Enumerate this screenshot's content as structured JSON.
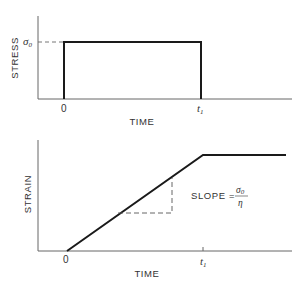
{
  "diagram": {
    "top_plot": {
      "ylabel": "STRESS",
      "xlabel": "TIME",
      "y_tick_label": "σ",
      "y_tick_sub": "0",
      "x_ticks": [
        "0",
        "t"
      ],
      "x_tick_t1_sub": "1",
      "curve": "rectangular stress pulse of magnitude σ0 from time 0 to t1"
    },
    "bottom_plot": {
      "ylabel": "STRAIN",
      "xlabel": "TIME",
      "x_ticks": [
        "0",
        "t"
      ],
      "x_tick_t1_sub": "1",
      "slope_label": "SLOPE =",
      "slope_numerator": "σ",
      "slope_numerator_sub": "0",
      "slope_denominator": "η",
      "curve": "strain rises linearly from 0 to t1, then remains constant"
    },
    "colors": {
      "line": "#1a1a1a",
      "axis": "#555555",
      "text": "#333333"
    }
  }
}
